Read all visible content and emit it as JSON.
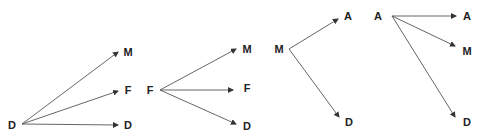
{
  "diagrams": [
    {
      "source": {
        "label": "D",
        "x": 12,
        "y": 125
      },
      "origin": [
        22,
        124
      ],
      "targets": [
        {
          "label": "M",
          "x": 128,
          "y": 52,
          "tip": [
            118,
            52
          ]
        },
        {
          "label": "F",
          "x": 128,
          "y": 90,
          "tip": [
            118,
            91
          ]
        },
        {
          "label": "D",
          "x": 128,
          "y": 125,
          "tip": [
            118,
            125
          ]
        }
      ]
    },
    {
      "source": {
        "label": "F",
        "x": 150,
        "y": 90
      },
      "origin": [
        160,
        90
      ],
      "targets": [
        {
          "label": "M",
          "x": 247,
          "y": 49,
          "tip": [
            236,
            49
          ]
        },
        {
          "label": "F",
          "x": 247,
          "y": 88,
          "tip": [
            233,
            90
          ]
        },
        {
          "label": "D",
          "x": 247,
          "y": 126,
          "tip": [
            236,
            124
          ]
        }
      ]
    },
    {
      "source": {
        "label": "M",
        "x": 279,
        "y": 49
      },
      "origin": [
        289,
        49
      ],
      "targets": [
        {
          "label": "A",
          "x": 348,
          "y": 16,
          "tip": [
            338,
            19
          ]
        },
        {
          "label": "D",
          "x": 349,
          "y": 122,
          "tip": [
            339,
            117
          ]
        }
      ]
    },
    {
      "source": {
        "label": "A",
        "x": 378,
        "y": 16
      },
      "origin": [
        392,
        16
      ],
      "targets": [
        {
          "label": "A",
          "x": 467,
          "y": 16,
          "tip": [
            456,
            16
          ]
        },
        {
          "label": "M",
          "x": 467,
          "y": 51,
          "tip": [
            455,
            46
          ]
        },
        {
          "label": "D",
          "x": 467,
          "y": 122,
          "tip": [
            455,
            117
          ]
        }
      ]
    }
  ],
  "colors": {
    "line": "#555555",
    "text": "#222222",
    "background": "#ffffff"
  }
}
